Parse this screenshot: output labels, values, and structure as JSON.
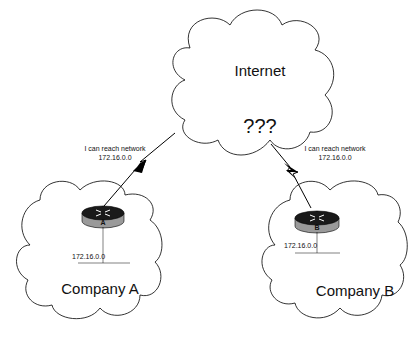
{
  "internet": {
    "title": "Internet",
    "status": "???"
  },
  "company_a": {
    "name": "Company A",
    "router_label": "A",
    "network": "172.16.0.0",
    "advert_line1": "I can reach network",
    "advert_line2": "172.16.0.0"
  },
  "company_b": {
    "name": "Company B",
    "router_label": "B",
    "network": "172.16.0.0",
    "advert_line1": "I can reach network",
    "advert_line2": "172.16.0.0"
  },
  "colors": {
    "line": "#000000",
    "router_top": "#1a1a1a",
    "router_side": "#9a9a9a"
  }
}
